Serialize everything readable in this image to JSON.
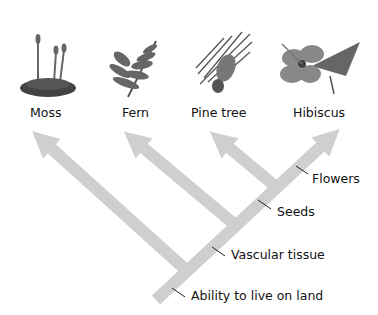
{
  "taxa": [
    {
      "name": "Moss",
      "icon": "moss-icon"
    },
    {
      "name": "Fern",
      "icon": "fern-icon"
    },
    {
      "name": "Pine tree",
      "icon": "pine-tree-icon"
    },
    {
      "name": "Hibiscus",
      "icon": "hibiscus-icon"
    }
  ],
  "traits": [
    {
      "label": "Ability to live on land"
    },
    {
      "label": "Vascular tissue"
    },
    {
      "label": "Seeds"
    },
    {
      "label": "Flowers"
    }
  ],
  "colors": {
    "branch": "#cfcfcf",
    "branch_edge": "#bdbdbd",
    "text": "#111111",
    "plant": "#555555"
  }
}
